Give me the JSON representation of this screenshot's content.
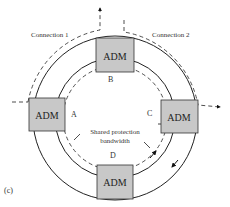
{
  "figure": {
    "panel_label": "(c)",
    "connections": [
      {
        "id": "connection-1",
        "label": "Connection 1"
      },
      {
        "id": "connection-2",
        "label": "Connection 2"
      }
    ],
    "nodes": [
      {
        "id": "adm-top",
        "label": "ADM"
      },
      {
        "id": "adm-left",
        "label": "ADM"
      },
      {
        "id": "adm-right",
        "label": "ADM"
      },
      {
        "id": "adm-bottom",
        "label": "ADM"
      }
    ],
    "points": {
      "a": "A",
      "b": "B",
      "c": "C",
      "d": "D"
    },
    "center_label": {
      "line1": "Shared protection",
      "line2": "bandwidth"
    },
    "colors": {
      "adm_fill": "#c8c8c8",
      "adm_stroke": "#333333",
      "line": "#222222"
    }
  }
}
